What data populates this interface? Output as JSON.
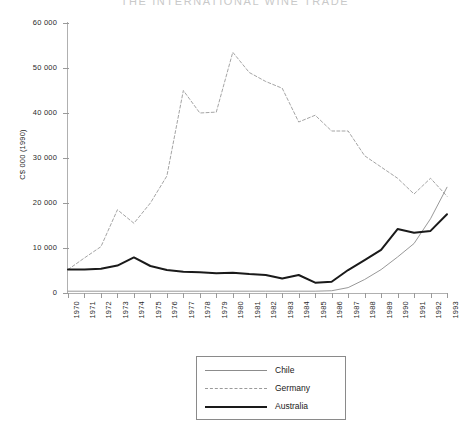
{
  "chart_data": {
    "type": "line",
    "title": "THE INTERNATIONAL WINE TRADE",
    "xlabel": "",
    "ylabel": "C$ 000 (1990)",
    "xlim": [
      1970,
      1993
    ],
    "ylim": [
      0,
      60000
    ],
    "ytick_values": [
      0,
      10000,
      20000,
      30000,
      40000,
      50000,
      60000
    ],
    "ytick_labels": [
      "0",
      "10 000",
      "20 000",
      "30 000",
      "40 000",
      "50 000",
      "60 000"
    ],
    "x": [
      1970,
      1971,
      1972,
      1973,
      1974,
      1975,
      1976,
      1977,
      1978,
      1979,
      1980,
      1981,
      1982,
      1983,
      1984,
      1985,
      1986,
      1987,
      1988,
      1989,
      1990,
      1991,
      1992,
      1993
    ],
    "xtick_labels": [
      "1970",
      "1971",
      "1972",
      "1973",
      "1974",
      "1975",
      "1976",
      "1977",
      "1978",
      "1979",
      "1980",
      "1981",
      "1982",
      "1983",
      "1984",
      "1985",
      "1986",
      "1987",
      "1988",
      "1989",
      "1990",
      "1991",
      "1992",
      "1993"
    ],
    "grid": false,
    "legend_position": "below-center",
    "series": [
      {
        "name": "Chile",
        "style": "solid-thin",
        "color": "#8c8c8c",
        "values": [
          400,
          400,
          400,
          400,
          400,
          400,
          400,
          400,
          400,
          400,
          400,
          400,
          400,
          400,
          400,
          400,
          500,
          1200,
          3000,
          5200,
          8000,
          11000,
          16500,
          23500
        ]
      },
      {
        "name": "Germany",
        "style": "dashed",
        "color": "#9a9a9a",
        "values": [
          5200,
          7800,
          10300,
          18500,
          15500,
          20000,
          26000,
          45000,
          40000,
          40200,
          53500,
          49000,
          47000,
          45500,
          38000,
          39500,
          36000,
          36000,
          30500,
          28000,
          25500,
          22000,
          25500,
          21500
        ]
      },
      {
        "name": "Australia",
        "style": "solid-thick",
        "color": "#1a1a1a",
        "values": [
          5200,
          5200,
          5400,
          6100,
          7900,
          6000,
          5100,
          4700,
          4600,
          4400,
          4500,
          4200,
          4000,
          3200,
          4000,
          2300,
          2500,
          5100,
          7300,
          9600,
          14200,
          13400,
          13800,
          17500
        ]
      }
    ]
  },
  "legend": {
    "items": [
      {
        "label": "Chile"
      },
      {
        "label": "Germany"
      },
      {
        "label": "Australia"
      }
    ]
  }
}
